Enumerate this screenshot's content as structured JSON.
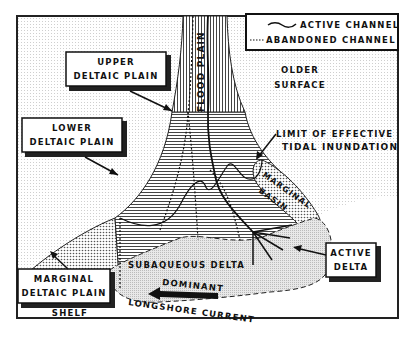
{
  "diagram": {
    "legend": {
      "active_channel": "ACTIVE CHANNEL",
      "abandoned_channel": "ABANDONED CHANNEL"
    },
    "labels": {
      "flood_plain": "FLOOD PLAIN",
      "upper_deltaic_plain_1": "UPPER",
      "upper_deltaic_plain_2": "DELTAIC PLAIN",
      "lower_deltaic_plain_1": "LOWER",
      "lower_deltaic_plain_2": "DELTAIC PLAIN",
      "older_surface_1": "OLDER",
      "older_surface_2": "SURFACE",
      "limit_tidal_1": "LIMIT OF EFFECTIVE",
      "limit_tidal_2": "TIDAL INUNDATION",
      "marginal_basin_1": "MARGINAL",
      "marginal_basin_2": "BASIN",
      "subaqueous_delta": "SUBAQUEOUS DELTA",
      "active_delta_1": "ACTIVE",
      "active_delta_2": "DELTA",
      "marginal_deltaic_plain_1": "MARGINAL",
      "marginal_deltaic_plain_2": "DELTAIC PLAIN",
      "shelf": "SHELF",
      "dominant": "DOMINANT",
      "longshore_current": "LONGSHORE CURRENT"
    },
    "colors": {
      "ink": "#111111",
      "paper": "#ffffff",
      "stipple": "#d9d9d9",
      "subaqueous": "#e6e6e6"
    }
  }
}
